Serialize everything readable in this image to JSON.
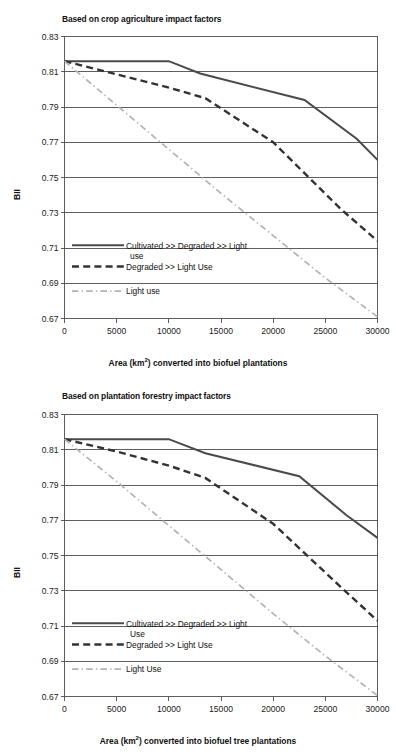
{
  "figure": {
    "panels": [
      {
        "id": "crop-agriculture",
        "title": "Based on crop agriculture impact factors",
        "xlabel_pre": "Area (km",
        "xlabel_sup": "2",
        "xlabel_post": ") converted into biofuel  plantations",
        "ylabel": "BII",
        "legend": [
          {
            "label_line1": "Cultivated >> Degraded >> Light",
            "label_line2": "use",
            "style": "solid"
          },
          {
            "label_line1": "Degraded >> Light Use",
            "label_line2": "",
            "style": "dashed"
          },
          {
            "label_line1": "Light use",
            "label_line2": "",
            "style": "dashdot"
          }
        ]
      },
      {
        "id": "plantation-forestry",
        "title": "Based on plantation  forestry impact factors",
        "xlabel_pre": "Area (km",
        "xlabel_sup": "2",
        "xlabel_post": ") converted into biofuel  tree plantations",
        "ylabel": "BII",
        "legend": [
          {
            "label_line1": "Cultivated >> Degraded >> Light",
            "label_line2": "Use",
            "style": "solid"
          },
          {
            "label_line1": "Degraded >> Light Use",
            "label_line2": "",
            "style": "dashed"
          },
          {
            "label_line1": "Light Use",
            "label_line2": "",
            "style": "dashdot"
          }
        ]
      }
    ]
  },
  "chart_data": [
    {
      "type": "line",
      "id": "crop-agriculture",
      "title": "Based on crop agriculture impact factors",
      "xlabel": "Area (km2) converted into biofuel  plantations",
      "ylabel": "BII",
      "xlim": [
        0,
        30000
      ],
      "ylim": [
        0.67,
        0.83
      ],
      "xticks": [
        0,
        5000,
        10000,
        15000,
        20000,
        25000,
        30000
      ],
      "xticklabels": [
        "0",
        "5000",
        "10000",
        "15000",
        "20000",
        "25000",
        "30000"
      ],
      "yticks": [
        0.67,
        0.69,
        0.71,
        0.73,
        0.75,
        0.77,
        0.79,
        0.81,
        0.83
      ],
      "yticklabels": [
        "0.67",
        "0.69",
        "0.71",
        "0.73",
        "0.75",
        "0.77",
        "0.79",
        "0.81",
        "0.83"
      ],
      "grid": true,
      "legend_position": "inside-lower-left",
      "series": [
        {
          "name": "Cultivated >> Degraded >> Light use",
          "style": "solid",
          "color": "#4a4a4a",
          "x": [
            0,
            10000,
            13000,
            23000,
            28000,
            30000
          ],
          "y": [
            0.816,
            0.816,
            0.809,
            0.794,
            0.772,
            0.76
          ]
        },
        {
          "name": "Degraded >> Light Use",
          "style": "dashed",
          "color": "#333333",
          "x": [
            0,
            5000,
            10000,
            13500,
            20000,
            26500,
            30000
          ],
          "y": [
            0.816,
            0.8085,
            0.801,
            0.795,
            0.77,
            0.732,
            0.714
          ]
        },
        {
          "name": "Light use",
          "style": "dashdot",
          "color": "#b3b3b3",
          "x": [
            0,
            5000,
            10000,
            15000,
            20000,
            25000,
            30000
          ],
          "y": [
            0.816,
            0.791,
            0.766,
            0.741,
            0.717,
            0.693,
            0.671
          ]
        }
      ]
    },
    {
      "type": "line",
      "id": "plantation-forestry",
      "title": "Based on plantation  forestry impact factors",
      "xlabel": "Area (km2) converted into biofuel  tree plantations",
      "ylabel": "BII",
      "xlim": [
        0,
        30000
      ],
      "ylim": [
        0.67,
        0.83
      ],
      "xticks": [
        0,
        5000,
        10000,
        15000,
        20000,
        25000,
        30000
      ],
      "xticklabels": [
        "0",
        "5000",
        "10000",
        "15000",
        "20000",
        "25000",
        "30000"
      ],
      "yticks": [
        0.67,
        0.69,
        0.71,
        0.73,
        0.75,
        0.77,
        0.79,
        0.81,
        0.83
      ],
      "yticklabels": [
        "0.67",
        "0.69",
        "0.71",
        "0.73",
        "0.75",
        "0.77",
        "0.79",
        "0.81",
        "0.83"
      ],
      "grid": true,
      "legend_position": "inside-lower-left",
      "series": [
        {
          "name": "Cultivated >> Degraded >> Light Use",
          "style": "solid",
          "color": "#4a4a4a",
          "x": [
            0,
            10000,
            13500,
            22500,
            27000,
            30000
          ],
          "y": [
            0.816,
            0.816,
            0.808,
            0.795,
            0.773,
            0.76
          ]
        },
        {
          "name": "Degraded >> Light Use",
          "style": "dashed",
          "color": "#333333",
          "x": [
            0,
            5000,
            10000,
            13500,
            20000,
            26500,
            30000
          ],
          "y": [
            0.816,
            0.809,
            0.801,
            0.794,
            0.768,
            0.732,
            0.713
          ]
        },
        {
          "name": "Light Use",
          "style": "dashdot",
          "color": "#b3b3b3",
          "x": [
            0,
            5000,
            10000,
            15000,
            20000,
            25000,
            30000
          ],
          "y": [
            0.816,
            0.792,
            0.767,
            0.742,
            0.717,
            0.693,
            0.6705
          ]
        }
      ]
    }
  ]
}
